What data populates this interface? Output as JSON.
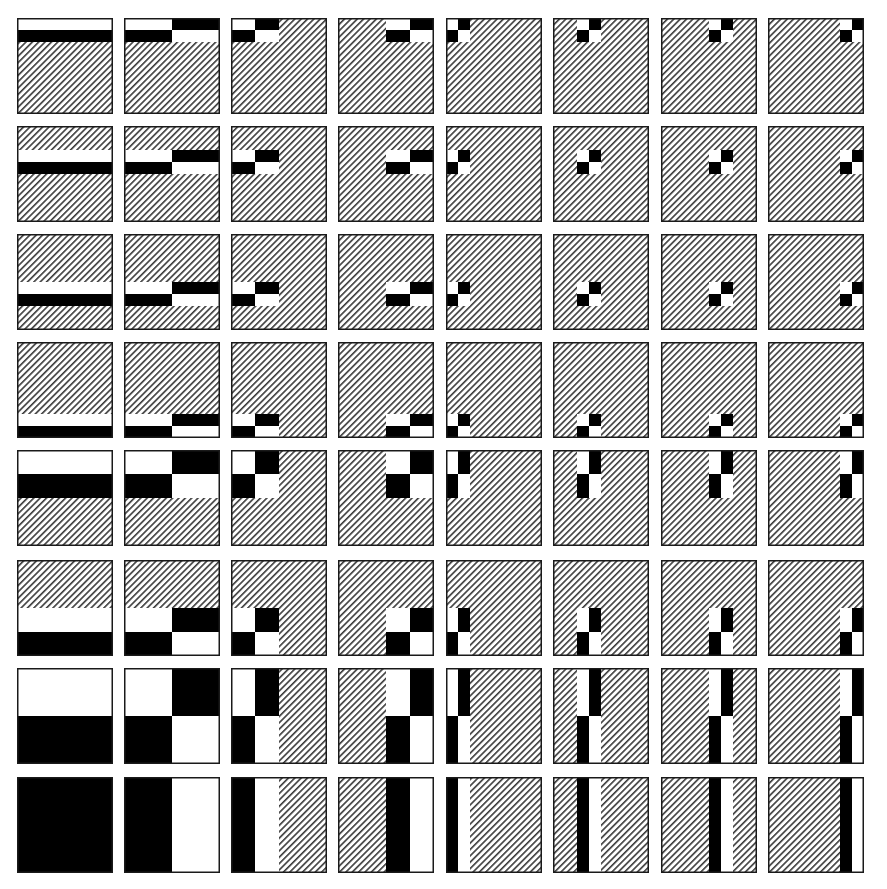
{
  "figure": {
    "title": "",
    "rows": 8,
    "cols": 8,
    "samples": 8,
    "colors": {
      "positive": "#000000",
      "negative": "#ffffff",
      "zero_hatch_line": "#3a3a3a",
      "zero_hatch_bg": "#ffffff",
      "border": "#1a1a1a",
      "background": "#ffffff"
    },
    "legend": {
      "positive": "black",
      "negative": "white",
      "zero": "diagonal hatching"
    },
    "layout": {
      "col_x": [
        17,
        124,
        231,
        338,
        446,
        553,
        661,
        768
      ],
      "row_y": [
        18,
        126,
        234,
        342,
        450,
        560,
        668,
        777
      ],
      "tile_w": 96,
      "tile_h": 96,
      "hatch_spacing": 4.5
    },
    "row_functions": [
      [
        -1,
        1,
        0,
        0,
        0,
        0,
        0,
        0
      ],
      [
        0,
        0,
        -1,
        1,
        0,
        0,
        0,
        0
      ],
      [
        0,
        0,
        0,
        0,
        -1,
        1,
        0,
        0
      ],
      [
        0,
        0,
        0,
        0,
        0,
        0,
        -1,
        1
      ],
      [
        -1,
        -1,
        1,
        1,
        0,
        0,
        0,
        0
      ],
      [
        0,
        0,
        0,
        0,
        -1,
        -1,
        1,
        1
      ],
      [
        -1,
        -1,
        -1,
        -1,
        1,
        1,
        1,
        1
      ],
      [
        1,
        1,
        1,
        1,
        1,
        1,
        1,
        1
      ]
    ],
    "col_functions": [
      [
        1,
        1,
        1,
        1,
        1,
        1,
        1,
        1
      ],
      [
        1,
        1,
        1,
        1,
        -1,
        -1,
        -1,
        -1
      ],
      [
        1,
        1,
        -1,
        -1,
        0,
        0,
        0,
        0
      ],
      [
        0,
        0,
        0,
        0,
        1,
        1,
        -1,
        -1
      ],
      [
        1,
        -1,
        0,
        0,
        0,
        0,
        0,
        0
      ],
      [
        0,
        0,
        1,
        -1,
        0,
        0,
        0,
        0
      ],
      [
        0,
        0,
        0,
        0,
        1,
        -1,
        0,
        0
      ],
      [
        0,
        0,
        0,
        0,
        0,
        0,
        1,
        -1
      ]
    ]
  }
}
